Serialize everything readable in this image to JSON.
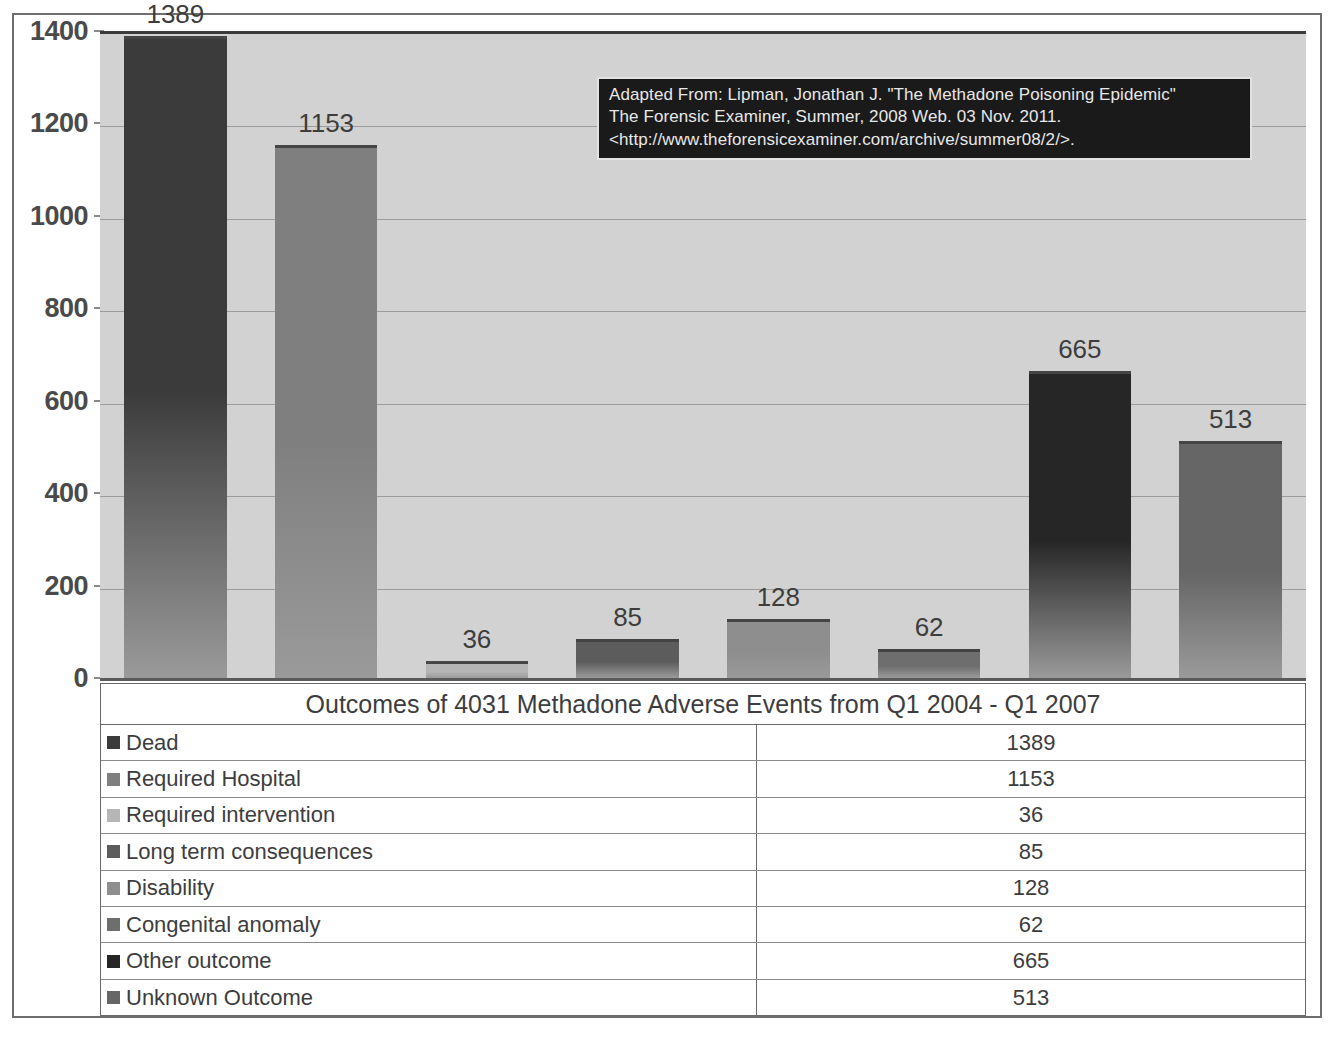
{
  "chart_data": {
    "type": "bar",
    "title": "Outcomes of 4031 Methadone Adverse Events from Q1 2004 - Q1 2007",
    "xlabel": "",
    "ylabel": "",
    "ylim": [
      0,
      1400
    ],
    "grid": true,
    "legend_position": "bottom-table",
    "categories": [
      "Dead",
      "Required Hospital",
      "Required intervention",
      "Long term consequences",
      "Disability",
      "Congenital anomaly",
      "Other outcome",
      "Unknown Outcome"
    ],
    "values": [
      1389,
      1153,
      36,
      85,
      128,
      62,
      665,
      513
    ],
    "bar_colors": [
      "#3b3b3b",
      "#7f7f7f",
      "#b6b6b6",
      "#5c5c5c",
      "#8e8e8e",
      "#6e6e6e",
      "#262626",
      "#666666"
    ],
    "y_ticks": [
      0,
      200,
      400,
      600,
      800,
      1000,
      1200,
      1400
    ],
    "y_tick_labels": [
      "0",
      "200",
      "400",
      "600",
      "800",
      "1000",
      "1200",
      "1400"
    ],
    "data_labels": [
      "1389",
      "1153",
      "36",
      "85",
      "128",
      "62",
      "665",
      "513"
    ],
    "annotation": {
      "lines": [
        "Adapted From: Lipman, Jonathan J. \"The Methadone Poisoning Epidemic\"",
        "The Forensic Examiner, Summer, 2008 Web. 03 Nov. 2011.",
        "<http://www.theforensicexaminer.com/archive/summer08/2/>."
      ],
      "background_color": "#1a1a1a",
      "text_color": "#e8e8e8"
    }
  },
  "table": {
    "title": "Outcomes of 4031 Methadone Adverse Events from Q1 2004 - Q1 2007",
    "rows": [
      {
        "label": "Dead",
        "value": "1389",
        "swatch": "#3b3b3b"
      },
      {
        "label": "Required Hospital",
        "value": "1153",
        "swatch": "#7f7f7f"
      },
      {
        "label": "Required intervention",
        "value": "36",
        "swatch": "#b6b6b6"
      },
      {
        "label": "Long term consequences",
        "value": "85",
        "swatch": "#5c5c5c"
      },
      {
        "label": "Disability",
        "value": "128",
        "swatch": "#8e8e8e"
      },
      {
        "label": "Congenital anomaly",
        "value": "62",
        "swatch": "#6e6e6e"
      },
      {
        "label": "Other outcome",
        "value": "665",
        "swatch": "#262626"
      },
      {
        "label": "Unknown Outcome",
        "value": "513",
        "swatch": "#666666"
      }
    ]
  },
  "colors": {
    "plot_background": "#d2d2d2",
    "gridline": "#9c9c9c",
    "axis": "#5a5a5a",
    "border": "#6e6e6e",
    "text": "#3d3d3d"
  }
}
